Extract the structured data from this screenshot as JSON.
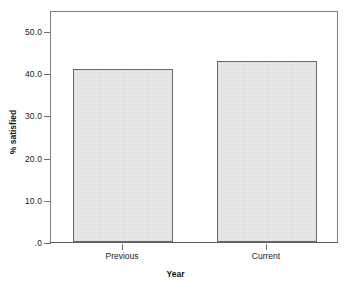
{
  "chart_data": {
    "type": "bar",
    "title": "",
    "categories": [
      "Previous",
      "Current"
    ],
    "values": [
      41.0,
      43.0
    ],
    "value_labels": [
      "41.0",
      "43.0"
    ],
    "xlabel": "Year",
    "ylabel": "% satisfied",
    "ylim": [
      0,
      55
    ],
    "yticks": [
      0,
      10,
      20,
      30,
      40,
      50
    ],
    "ytick_labels": [
      ".0",
      "10.0",
      "20.0",
      "30.0",
      "40.0",
      "50.0"
    ],
    "grid": false,
    "legend": null,
    "bar_fill_color": "#e9e9e9",
    "bar_border_color": "#6a6a6a",
    "frame_color": "#7d7d7d",
    "text_color": "#1a1a1a"
  },
  "axes": {
    "y_title": "% satisfied",
    "x_title": "Year"
  }
}
